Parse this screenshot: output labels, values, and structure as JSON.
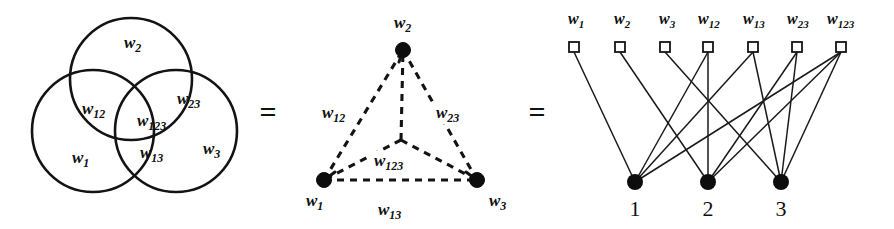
{
  "figure": {
    "equals_sign": "=",
    "colors": {
      "ink": "#131313",
      "background": "#ffffff"
    }
  },
  "venn": {
    "regions": [
      {
        "name": "region-w1",
        "base": "w",
        "sub": "1",
        "x": 72,
        "y": 163
      },
      {
        "name": "region-w2",
        "base": "w",
        "sub": "2",
        "x": 124,
        "y": 48
      },
      {
        "name": "region-w3",
        "base": "w",
        "sub": "3",
        "x": 203,
        "y": 154
      },
      {
        "name": "region-w12",
        "base": "w",
        "sub": "12",
        "x": 82,
        "y": 114
      },
      {
        "name": "region-w13",
        "base": "w",
        "sub": "13",
        "x": 140,
        "y": 158
      },
      {
        "name": "region-w23",
        "base": "w",
        "sub": "23",
        "x": 177,
        "y": 104
      },
      {
        "name": "region-w123",
        "base": "w",
        "sub": "123",
        "x": 137,
        "y": 126
      }
    ],
    "circles": [
      {
        "name": "venn-circle-set2",
        "cx": 131,
        "cy": 79,
        "r": 61
      },
      {
        "name": "venn-circle-set1",
        "cx": 93,
        "cy": 131,
        "r": 61
      },
      {
        "name": "venn-circle-set3",
        "cx": 176,
        "cy": 131,
        "r": 61
      }
    ]
  },
  "triangle": {
    "vertices": [
      {
        "name": "triangle-vertex-w1",
        "base": "w",
        "sub": "1",
        "cx": 324,
        "cy": 180,
        "label_x": 306,
        "label_y": 206
      },
      {
        "name": "triangle-vertex-w2",
        "base": "w",
        "sub": "2",
        "cx": 403,
        "cy": 50,
        "label_x": 394,
        "label_y": 28
      },
      {
        "name": "triangle-vertex-w3",
        "base": "w",
        "sub": "3",
        "cx": 477,
        "cy": 180,
        "label_x": 489,
        "label_y": 206
      }
    ],
    "edge_labels": [
      {
        "name": "triangle-edge-label-w12",
        "base": "w",
        "sub": "12",
        "x": 322,
        "y": 118
      },
      {
        "name": "triangle-edge-label-w23",
        "base": "w",
        "sub": "23",
        "x": 436,
        "y": 118
      },
      {
        "name": "triangle-edge-label-w13",
        "base": "w",
        "sub": "13",
        "x": 378,
        "y": 215
      },
      {
        "name": "triangle-edge-label-w123",
        "base": "w",
        "sub": "123",
        "x": 374,
        "y": 166
      }
    ],
    "hyperedge_center": {
      "x": 401,
      "y": 140
    }
  },
  "bipartite": {
    "weight_nodes": [
      {
        "name": "bipartite-weight-w1",
        "base": "w",
        "sub": "1",
        "x": 574,
        "label_x": 568,
        "connects": [
          1
        ]
      },
      {
        "name": "bipartite-weight-w2",
        "base": "w",
        "sub": "2",
        "x": 620,
        "label_x": 614,
        "connects": [
          2
        ]
      },
      {
        "name": "bipartite-weight-w3",
        "base": "w",
        "sub": "3",
        "x": 665,
        "label_x": 659,
        "connects": [
          3
        ]
      },
      {
        "name": "bipartite-weight-w12",
        "base": "w",
        "sub": "12",
        "x": 708,
        "label_x": 698,
        "connects": [
          1,
          2
        ]
      },
      {
        "name": "bipartite-weight-w13",
        "base": "w",
        "sub": "13",
        "x": 753,
        "label_x": 743,
        "connects": [
          1,
          3
        ]
      },
      {
        "name": "bipartite-weight-w23",
        "base": "w",
        "sub": "23",
        "x": 797,
        "label_x": 787,
        "connects": [
          2,
          3
        ]
      },
      {
        "name": "bipartite-weight-w123",
        "base": "w",
        "sub": "123",
        "x": 841,
        "label_x": 827,
        "connects": [
          1,
          2,
          3
        ]
      }
    ],
    "element_nodes": [
      {
        "name": "bipartite-element-1",
        "label": "1",
        "id": 1,
        "x": 635,
        "y": 182
      },
      {
        "name": "bipartite-element-2",
        "label": "2",
        "id": 2,
        "x": 708,
        "y": 182
      },
      {
        "name": "bipartite-element-3",
        "label": "3",
        "id": 3,
        "x": 781,
        "y": 182
      }
    ],
    "square_y": 47,
    "label_y": 24
  },
  "equals": [
    {
      "name": "equals-sign-1",
      "text": "=",
      "x": 268,
      "y": 122
    },
    {
      "name": "equals-sign-2",
      "text": "=",
      "x": 537,
      "y": 122
    }
  ]
}
